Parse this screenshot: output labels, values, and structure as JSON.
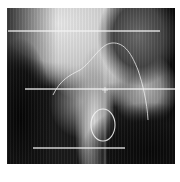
{
  "image": {
    "subject": "lateral head and neck radiograph",
    "frame": {
      "x": 7,
      "y": 8,
      "width": 168,
      "height": 156
    },
    "background_color": "#ffffff"
  },
  "annotations": {
    "stroke_color": "#f2f2f2",
    "horizontal_lines": [
      {
        "x1": 8,
        "y1": 31,
        "x2": 160,
        "y2": 31
      },
      {
        "x1": 25,
        "y1": 89,
        "x2": 175,
        "y2": 89
      },
      {
        "x1": 33,
        "y1": 148,
        "x2": 125,
        "y2": 148
      }
    ],
    "vertical_lines": [
      {
        "x1": 105,
        "y1": 8,
        "x2": 105,
        "y2": 164
      }
    ],
    "arch_curve_path": "M53 95 C60 80, 70 75, 80 70 C92 62, 100 44, 112 43 C125 42, 132 55, 138 70 C143 85, 147 102, 148 120",
    "oval": {
      "cx": 103,
      "cy": 125,
      "rx": 12,
      "ry": 16
    },
    "marker": {
      "x": 105,
      "y": 90
    }
  }
}
